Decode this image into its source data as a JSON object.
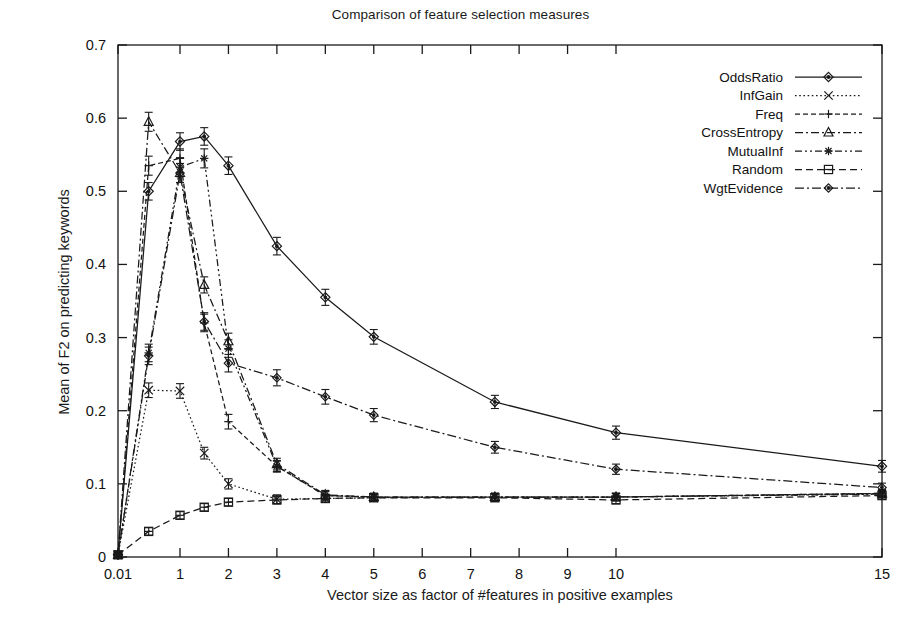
{
  "chart_data": {
    "type": "line",
    "title": "Comparison of feature selection measures",
    "xlabel": "Vector size as factor of #features in positive examples",
    "ylabel": "Mean of F2 on predicting keywords",
    "grid": false,
    "legend_position": "top-right",
    "error_bars": true,
    "ylim": [
      0,
      0.7
    ],
    "yticks": [
      "0",
      "0.1",
      "0.2",
      "0.3",
      "0.4",
      "0.5",
      "0.6",
      "0.7"
    ],
    "ytick_values": [
      0,
      0.1,
      0.2,
      0.3,
      0.4,
      0.5,
      0.6,
      0.7
    ],
    "xticks": [
      "0.01",
      "1",
      "2",
      "3",
      "4",
      "5",
      "6",
      "7",
      "8",
      "9",
      "10",
      "15"
    ],
    "xtick_values": [
      0.01,
      1,
      2,
      3,
      4,
      5,
      6,
      7,
      8,
      9,
      10,
      15
    ],
    "x": [
      0.01,
      0.5,
      1,
      1.5,
      2,
      3,
      4,
      5,
      7.5,
      10,
      15
    ],
    "series": [
      {
        "name": "OddsRatio",
        "marker": "diamond",
        "dash": "solid",
        "color": "#1a1a1a",
        "values": [
          0.003,
          0.5,
          0.568,
          0.575,
          0.535,
          0.425,
          0.355,
          0.301,
          0.212,
          0.17,
          0.124
        ],
        "errors": [
          0.004,
          0.012,
          0.012,
          0.012,
          0.012,
          0.012,
          0.011,
          0.01,
          0.009,
          0.009,
          0.008
        ]
      },
      {
        "name": "InfGain",
        "marker": "cross",
        "dash": "dotted",
        "color": "#1a1a1a",
        "values": [
          0.003,
          0.228,
          0.227,
          0.142,
          0.1,
          0.079,
          0.08,
          0.081,
          0.082,
          0.082,
          0.086
        ],
        "errors": [
          0.004,
          0.01,
          0.01,
          0.008,
          0.007,
          0.006,
          0.005,
          0.005,
          0.005,
          0.005,
          0.005
        ]
      },
      {
        "name": "Freq",
        "marker": "plus",
        "dash": "dash-fine",
        "color": "#1a1a1a",
        "values": [
          0.003,
          0.535,
          0.545,
          0.32,
          0.185,
          0.124,
          0.084,
          0.082,
          0.082,
          0.082,
          0.087
        ],
        "errors": [
          0.004,
          0.013,
          0.013,
          0.012,
          0.01,
          0.007,
          0.006,
          0.005,
          0.005,
          0.005,
          0.005
        ]
      },
      {
        "name": "CrossEntropy",
        "marker": "triangle",
        "dash": "dashdot",
        "color": "#1a1a1a",
        "values": [
          0.003,
          0.595,
          0.525,
          0.372,
          0.295,
          0.127,
          0.085,
          0.082,
          0.082,
          0.082,
          0.087
        ],
        "errors": [
          0.004,
          0.013,
          0.013,
          0.011,
          0.011,
          0.008,
          0.006,
          0.005,
          0.005,
          0.005,
          0.005
        ]
      },
      {
        "name": "MutualInf",
        "marker": "star",
        "dash": "dashdot2",
        "color": "#1a1a1a",
        "values": [
          0.003,
          0.279,
          0.533,
          0.545,
          0.285,
          0.124,
          0.084,
          0.082,
          0.082,
          0.082,
          0.086
        ],
        "errors": [
          0.004,
          0.012,
          0.013,
          0.013,
          0.012,
          0.008,
          0.006,
          0.005,
          0.005,
          0.005,
          0.005
        ]
      },
      {
        "name": "Random",
        "marker": "square",
        "dash": "dashed",
        "color": "#1a1a1a",
        "values": [
          0.003,
          0.035,
          0.057,
          0.068,
          0.075,
          0.078,
          0.08,
          0.081,
          0.081,
          0.078,
          0.084
        ],
        "errors": [
          0.004,
          0.005,
          0.005,
          0.005,
          0.005,
          0.005,
          0.005,
          0.005,
          0.005,
          0.005,
          0.005
        ]
      },
      {
        "name": "WgtEvidence",
        "marker": "diamond-small",
        "dash": "dashdot3",
        "color": "#1a1a1a",
        "values": [
          0.003,
          0.275,
          0.525,
          0.322,
          0.265,
          0.245,
          0.219,
          0.194,
          0.15,
          0.12,
          0.095
        ],
        "errors": [
          0.004,
          0.012,
          0.013,
          0.012,
          0.012,
          0.011,
          0.01,
          0.009,
          0.008,
          0.007,
          0.006
        ]
      }
    ]
  }
}
